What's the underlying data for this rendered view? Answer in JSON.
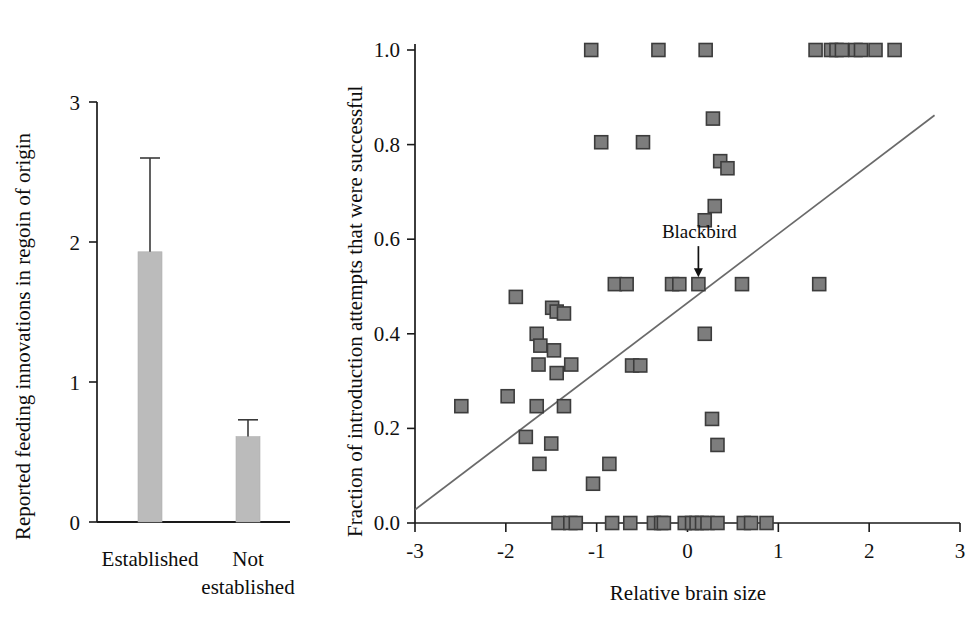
{
  "figure": {
    "background": "#ffffff",
    "marker_fill": "#7d7d7d",
    "marker_stroke": "#3c3c3c",
    "bar_fill": "#bbbbbb",
    "line_color": "#6a6a6a"
  },
  "chart_data": [
    {
      "type": "bar",
      "title": "",
      "xlabel": "",
      "ylabel": "Reported feeding innovations in regoin of origin",
      "categories": [
        "Established",
        "Not established"
      ],
      "category_lines": [
        [
          "Established"
        ],
        [
          "Not",
          "established"
        ]
      ],
      "values": [
        1.93,
        0.61
      ],
      "errors_upper": [
        0.67,
        0.12
      ],
      "ylim": [
        0,
        3
      ],
      "yticks": [
        0,
        1,
        2,
        3
      ],
      "ytick_labels": [
        "0",
        "1",
        "2",
        "3"
      ],
      "grid": false,
      "legend": "none"
    },
    {
      "type": "scatter",
      "title": "",
      "xlabel": "Relative brain size",
      "ylabel": "Fraction of introduction attempts that were successful",
      "xlim": [
        -3,
        3
      ],
      "ylim": [
        0.0,
        1.0
      ],
      "xticks": [
        -3,
        -2,
        -1,
        0,
        1,
        2,
        3
      ],
      "xtick_labels": [
        "-3",
        "-2",
        "-1",
        "0",
        "1",
        "2",
        "3"
      ],
      "yticks": [
        0.0,
        0.2,
        0.4,
        0.6,
        0.8,
        1.0
      ],
      "ytick_labels": [
        "0.0",
        "0.2",
        "0.4",
        "0.6",
        "0.8",
        "1.0"
      ],
      "grid": false,
      "legend": "none",
      "points": [
        [
          -1.06,
          1.0
        ],
        [
          -0.32,
          1.0
        ],
        [
          0.2,
          1.0
        ],
        [
          1.41,
          1.0
        ],
        [
          1.58,
          1.0
        ],
        [
          1.64,
          1.0
        ],
        [
          1.7,
          1.0
        ],
        [
          1.85,
          1.0
        ],
        [
          1.91,
          1.0
        ],
        [
          2.07,
          1.0
        ],
        [
          2.28,
          1.0
        ],
        [
          0.28,
          0.855
        ],
        [
          -0.95,
          0.805
        ],
        [
          -0.49,
          0.805
        ],
        [
          0.36,
          0.765
        ],
        [
          0.44,
          0.75
        ],
        [
          0.3,
          0.67
        ],
        [
          0.19,
          0.64
        ],
        [
          -0.8,
          0.505
        ],
        [
          -0.67,
          0.505
        ],
        [
          -0.17,
          0.505
        ],
        [
          -0.09,
          0.505
        ],
        [
          0.12,
          0.505
        ],
        [
          0.6,
          0.505
        ],
        [
          1.45,
          0.505
        ],
        [
          -1.89,
          0.478
        ],
        [
          -1.49,
          0.455
        ],
        [
          -1.44,
          0.447
        ],
        [
          -1.36,
          0.443
        ],
        [
          -1.66,
          0.4
        ],
        [
          0.19,
          0.4
        ],
        [
          -1.62,
          0.375
        ],
        [
          -1.47,
          0.365
        ],
        [
          -1.64,
          0.335
        ],
        [
          -1.28,
          0.335
        ],
        [
          -0.61,
          0.333
        ],
        [
          -0.52,
          0.333
        ],
        [
          -1.44,
          0.317
        ],
        [
          -1.98,
          0.268
        ],
        [
          -2.49,
          0.247
        ],
        [
          -1.66,
          0.247
        ],
        [
          -1.36,
          0.247
        ],
        [
          0.27,
          0.22
        ],
        [
          -1.78,
          0.182
        ],
        [
          -1.5,
          0.168
        ],
        [
          0.33,
          0.165
        ],
        [
          -1.63,
          0.125
        ],
        [
          -0.86,
          0.125
        ],
        [
          -1.04,
          0.083
        ],
        [
          -1.42,
          0.0
        ],
        [
          -1.29,
          0.0
        ],
        [
          -1.23,
          0.0
        ],
        [
          -0.83,
          0.0
        ],
        [
          -0.63,
          0.0
        ],
        [
          -0.37,
          0.0
        ],
        [
          -0.29,
          0.0
        ],
        [
          -0.26,
          0.0
        ],
        [
          -0.03,
          0.0
        ],
        [
          0.05,
          0.0
        ],
        [
          0.1,
          0.0
        ],
        [
          0.16,
          0.0
        ],
        [
          0.22,
          0.0
        ],
        [
          0.33,
          0.0
        ],
        [
          0.62,
          0.0
        ],
        [
          0.7,
          0.0
        ],
        [
          0.87,
          0.0
        ]
      ],
      "trendline": {
        "x0": -3.0,
        "y0": 0.028,
        "x1": 2.72,
        "y1": 0.862
      },
      "annotations": [
        {
          "text": "Blackbird",
          "target_x": 0.12,
          "target_y": 0.505
        }
      ]
    }
  ]
}
